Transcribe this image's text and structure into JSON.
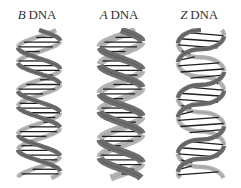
{
  "labels": [
    {
      "letter": "B",
      "suffix": " DNA",
      "center_x": 37
    },
    {
      "letter": "A",
      "suffix": " DNA",
      "center_x": 119
    },
    {
      "letter": "Z",
      "suffix": " DNA",
      "center_x": 199
    }
  ],
  "helices": [
    {
      "name": "B-DNA",
      "x": 14,
      "width": 46,
      "height": 148,
      "turns": 3.4,
      "handedness": "right",
      "style": "smooth"
    },
    {
      "name": "A-DNA",
      "x": 98,
      "width": 46,
      "height": 148,
      "turns": 3.2,
      "handedness": "right",
      "style": "wide-groove"
    },
    {
      "name": "Z-DNA",
      "x": 175,
      "width": 50,
      "height": 148,
      "turns": 2.7,
      "handedness": "left",
      "style": "zigzag"
    }
  ],
  "colors": {
    "background": "#ffffff",
    "strand_dark": "#6e6e6e",
    "strand_light": "#b4b4b4",
    "base_pair": "#1e1e1e",
    "label": "#333333"
  }
}
